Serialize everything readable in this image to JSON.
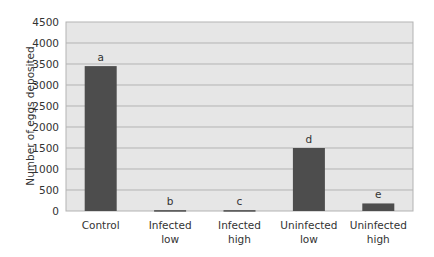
{
  "chart_data": {
    "type": "bar",
    "title": "",
    "xlabel": "",
    "ylabel": "Number of eggs deposited",
    "ylim": [
      0,
      4500
    ],
    "yticks": [
      0,
      500,
      1000,
      1500,
      2000,
      2500,
      3000,
      3500,
      4000,
      4500
    ],
    "grid": true,
    "legend": null,
    "categories": [
      [
        "Control"
      ],
      [
        "Infected",
        "low"
      ],
      [
        "Infected",
        "high"
      ],
      [
        "Uninfected",
        "low"
      ],
      [
        "Uninfected",
        "high"
      ]
    ],
    "values": [
      3450,
      20,
      20,
      1500,
      180
    ],
    "annotations": [
      "a",
      "b",
      "c",
      "d",
      "e"
    ],
    "colors": {
      "bar": "#4d4d4d",
      "plot_background": "#e6e6e6",
      "gridline": "#b3b3b3",
      "border": "#b3b3b3"
    }
  }
}
